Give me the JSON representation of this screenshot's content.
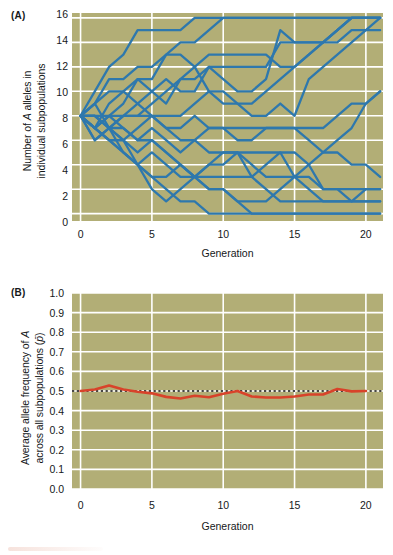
{
  "figure": {
    "background_color": "#ffffff",
    "plot_background_color": "#b2ae76",
    "gridline_color": "#ffffff"
  },
  "panel_a": {
    "label": "(A)",
    "ylabel_line1": "Number of A alleles in",
    "ylabel_line2": "individual subpopulations",
    "ylabel_italic_token": "A",
    "xlabel": "Generation",
    "yticks": [
      "16",
      "14",
      "12",
      "10",
      "8",
      "6",
      "4",
      "2",
      "0"
    ],
    "xticks": [
      "0",
      "5",
      "10",
      "15",
      "20"
    ],
    "line_color": "#2e78ad"
  },
  "panel_b": {
    "label": "(B)",
    "ylabel_line1": "Average allele frequency of A",
    "ylabel_line2": "across all subpopulations (p̄)",
    "ylabel_italic_token": "A",
    "xlabel": "Generation",
    "yticks": [
      "1.0",
      "0.9",
      "0.8",
      "0.7",
      "0.6",
      "0.5",
      "0.4",
      "0.3",
      "0.2",
      "0.1",
      "0.0"
    ],
    "xticks": [
      "0",
      "5",
      "10",
      "15",
      "20"
    ],
    "line_color": "#d8432a",
    "reference_line_color": "#111111",
    "reference_line_style": "dotted",
    "reference_line_value": 0.5
  },
  "chart_data": [
    {
      "type": "line",
      "panel": "(A)",
      "title": "",
      "xlabel": "Generation",
      "ylabel": "Number of A alleles in individual subpopulations",
      "xlim": [
        -0.6,
        21.2
      ],
      "ylim": [
        -0.6,
        16.4
      ],
      "xticks": [
        0,
        5,
        10,
        15,
        20
      ],
      "yticks": [
        0,
        2,
        4,
        6,
        8,
        10,
        12,
        14,
        16
      ],
      "grid": true,
      "legend": "none",
      "x": [
        0,
        1,
        2,
        3,
        4,
        5,
        6,
        7,
        8,
        9,
        10,
        11,
        12,
        13,
        14,
        15,
        16,
        17,
        18,
        19,
        20,
        21
      ],
      "series": [
        {
          "name": "subpop-1",
          "values": [
            8,
            10,
            12,
            13,
            15,
            15,
            15,
            15,
            16,
            16,
            16,
            16,
            16,
            16,
            16,
            16,
            16,
            16,
            16,
            16,
            16,
            16
          ]
        },
        {
          "name": "subpop-2",
          "values": [
            8,
            9,
            11,
            11,
            12,
            12,
            13,
            14,
            14,
            15,
            16,
            16,
            16,
            16,
            16,
            16,
            16,
            16,
            16,
            16,
            16,
            16
          ]
        },
        {
          "name": "subpop-3",
          "values": [
            8,
            7,
            8,
            9,
            11,
            11,
            13,
            13,
            12,
            13,
            13,
            13,
            13,
            13,
            12,
            12,
            13,
            14,
            15,
            16,
            16,
            16
          ]
        },
        {
          "name": "subpop-4",
          "values": [
            8,
            8,
            7,
            8,
            8,
            9,
            10,
            11,
            11,
            12,
            12,
            12,
            12,
            12,
            14,
            14,
            14,
            14,
            15,
            16,
            16,
            16
          ]
        },
        {
          "name": "subpop-5",
          "values": [
            8,
            7,
            9,
            10,
            11,
            10,
            9,
            11,
            12,
            10,
            9,
            9,
            9,
            10,
            11,
            12,
            13,
            14,
            14,
            15,
            15,
            15
          ]
        },
        {
          "name": "subpop-6",
          "values": [
            8,
            9,
            7,
            8,
            9,
            10,
            11,
            10,
            10,
            12,
            11,
            10,
            10,
            11,
            15,
            14,
            14,
            14,
            15,
            16,
            16,
            16
          ]
        },
        {
          "name": "subpop-7",
          "values": [
            8,
            6,
            7,
            6,
            7,
            8,
            8,
            8,
            9,
            10,
            10,
            9,
            8,
            8,
            9,
            8,
            11,
            12,
            13,
            14,
            15,
            16
          ]
        },
        {
          "name": "subpop-8",
          "values": [
            8,
            7,
            8,
            8,
            8,
            8,
            7,
            7,
            8,
            7,
            7,
            7,
            7,
            7,
            7,
            7,
            6,
            5,
            5,
            4,
            4,
            3
          ]
        },
        {
          "name": "subpop-9",
          "values": [
            8,
            8,
            7,
            7,
            6,
            7,
            6,
            5,
            6,
            7,
            7,
            6,
            6,
            7,
            7,
            7,
            7,
            7,
            8,
            9,
            9,
            10
          ]
        },
        {
          "name": "subpop-10",
          "values": [
            8,
            7,
            6,
            6,
            5,
            6,
            5,
            4,
            3,
            4,
            4,
            5,
            5,
            5,
            5,
            5,
            4,
            2,
            2,
            2,
            2,
            2
          ]
        },
        {
          "name": "subpop-11",
          "values": [
            8,
            6,
            7,
            5,
            4,
            3,
            3,
            4,
            3,
            3,
            3,
            3,
            3,
            4,
            5,
            3,
            3,
            2,
            2,
            1,
            1,
            1
          ]
        },
        {
          "name": "subpop-12",
          "values": [
            8,
            7,
            6,
            5,
            4,
            5,
            4,
            3,
            3,
            4,
            5,
            5,
            3,
            2,
            1,
            1,
            1,
            1,
            1,
            1,
            1,
            1
          ]
        },
        {
          "name": "subpop-13",
          "values": [
            8,
            8,
            7,
            6,
            4,
            2,
            1,
            2,
            3,
            2,
            2,
            1,
            1,
            1,
            2,
            3,
            4,
            5,
            6,
            7,
            9,
            10
          ]
        },
        {
          "name": "subpop-14",
          "values": [
            8,
            7,
            6,
            5,
            4,
            3,
            2,
            1,
            1,
            0,
            0,
            0,
            0,
            0,
            0,
            0,
            0,
            0,
            0,
            0,
            0,
            0
          ]
        },
        {
          "name": "subpop-15",
          "values": [
            8,
            8,
            8,
            7,
            6,
            6,
            5,
            4,
            3,
            2,
            2,
            1,
            0,
            0,
            0,
            0,
            0,
            0,
            0,
            0,
            0,
            0
          ]
        },
        {
          "name": "subpop-16",
          "values": [
            8,
            9,
            10,
            10,
            9,
            8,
            7,
            6,
            6,
            5,
            5,
            5,
            4,
            3,
            3,
            3,
            2,
            1,
            1,
            1,
            2,
            2
          ]
        }
      ]
    },
    {
      "type": "line",
      "panel": "(B)",
      "title": "",
      "xlabel": "Generation",
      "ylabel": "Average allele frequency of A across all subpopulations (p̄)",
      "xlim": [
        -0.6,
        21.2
      ],
      "ylim": [
        0.0,
        1.0
      ],
      "xticks": [
        0,
        5,
        10,
        15,
        20
      ],
      "yticks": [
        0.0,
        0.1,
        0.2,
        0.3,
        0.4,
        0.5,
        0.6,
        0.7,
        0.8,
        0.9,
        1.0
      ],
      "grid": true,
      "legend": "none",
      "x": [
        0,
        1,
        2,
        3,
        4,
        5,
        6,
        7,
        8,
        9,
        10,
        11,
        12,
        13,
        14,
        15,
        16,
        17,
        18,
        19,
        20
      ],
      "series": [
        {
          "name": "average-allele-frequency",
          "values": [
            0.5,
            0.508,
            0.528,
            0.508,
            0.496,
            0.488,
            0.47,
            0.462,
            0.476,
            0.468,
            0.486,
            0.5,
            0.472,
            0.467,
            0.467,
            0.472,
            0.482,
            0.482,
            0.51,
            0.498,
            0.5
          ]
        }
      ],
      "annotations": [
        {
          "type": "hline",
          "value": 0.5,
          "style": "dotted",
          "color": "#111111"
        }
      ]
    }
  ]
}
